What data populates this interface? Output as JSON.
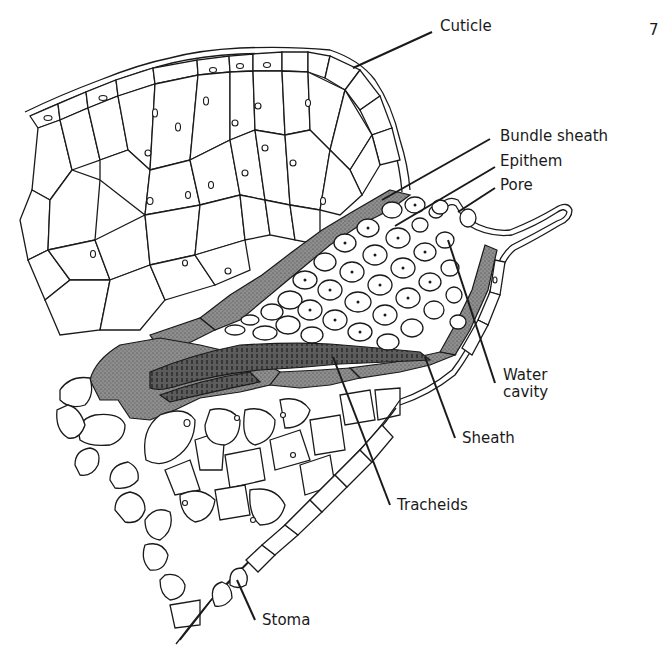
{
  "figure": {
    "colors": {
      "ink": "#1a1a1a",
      "sheath_fill": "#8a8a8a",
      "tracheid_fill": "#5a5a5a",
      "background": "#ffffff"
    }
  },
  "labels": {
    "cuticle": "Cuticle",
    "bundle_sheath": "Bundle sheath",
    "epithem": "Epithem",
    "pore": "Pore",
    "water_cavity_line1": "Water",
    "water_cavity_line2": "cavity",
    "sheath": "Sheath",
    "tracheids": "Tracheids",
    "stoma": "Stoma",
    "edge_fragment": "7"
  }
}
